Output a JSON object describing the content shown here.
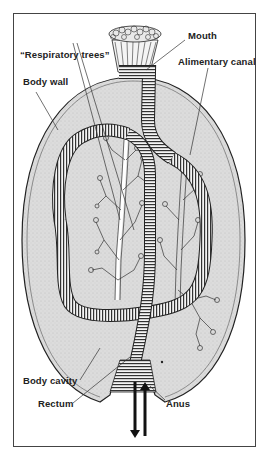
{
  "figure": {
    "labels": {
      "mouth": "Mouth",
      "respiratory_trees": "“Respiratory trees”",
      "alimentary_canal": "Alimentary canal",
      "body_wall": "Body wall",
      "body_cavity": "Body cavity",
      "rectum": "Rectum",
      "anus": "Anus"
    },
    "arrows": [
      "outflow-down",
      "inflow-up"
    ],
    "colors": {
      "frame": "#444444",
      "body_fill": "#d9d9d9",
      "outline": "#222222",
      "tree_fill": "#ffffff",
      "background": "#ffffff"
    }
  }
}
